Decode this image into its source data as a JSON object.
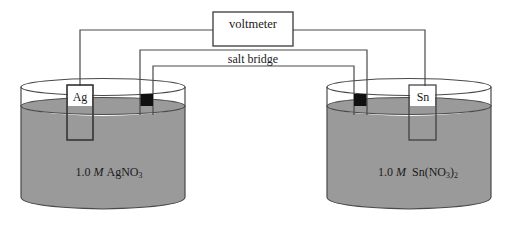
{
  "figure": {
    "background_color": "#ffffff",
    "line_color": "#3a3a3a",
    "solution_color": "#9a9a9a",
    "plug_color": "#101010"
  },
  "voltmeter": {
    "label": "voltmeter"
  },
  "salt_bridge": {
    "label": "salt bridge"
  },
  "left_cell": {
    "electrode_label": "Ag",
    "solution": {
      "concentration": "1.0",
      "molarity_symbol": "M",
      "formula_base": "AgNO",
      "formula_sub": "3",
      "full_text": "1.0 M AgNO3"
    }
  },
  "right_cell": {
    "electrode_label": "Sn",
    "solution": {
      "concentration": "1.0",
      "molarity_symbol": "M",
      "formula_prefix": "Sn(NO",
      "formula_sub1": "3",
      "formula_mid": ")",
      "formula_sub2": "2",
      "full_text": "1.0 M Sn(NO3)2"
    }
  },
  "icons": {
    "wire": "wire-line",
    "beaker": "beaker-shape",
    "electrode": "electrode-strip",
    "plug": "salt-bridge-plug"
  }
}
